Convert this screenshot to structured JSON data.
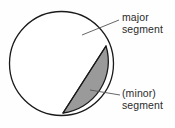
{
  "figure": {
    "background_color": "#fefefe",
    "stroke_color": "#1a1a1a",
    "fill_minor_segment": "#9a9a9a",
    "fill_major_segment": "#ffffff",
    "leader_color": "#555555"
  },
  "labels": {
    "major": {
      "line1": "major",
      "line2": "segment"
    },
    "minor": {
      "line1": "(minor)",
      "line2": "segment"
    }
  },
  "chart_data": {
    "type": "pie",
    "xlabel": "",
    "ylabel": "",
    "categories": [
      "major segment",
      "(minor) segment"
    ],
    "values": [
      81,
      19
    ],
    "legend": [
      "major segment",
      "(minor) segment"
    ],
    "annotations": [
      "major segment",
      "(minor) segment"
    ],
    "grid": false,
    "legend_position": "right",
    "geometry": {
      "circle_center_x": 61.5,
      "circle_center_y": 63.5,
      "circle_radius": 52,
      "chord_start_x": 106,
      "chord_start_y": 46,
      "chord_end_x": 63,
      "chord_end_y": 113,
      "minor_segment_fill": "#9a9a9a",
      "major_segment_fill": "#ffffff"
    },
    "leaders": [
      {
        "name": "major",
        "x1": 82,
        "y1": 35,
        "x2": 119,
        "y2": 20
      },
      {
        "name": "minor",
        "x1": 90,
        "y1": 90,
        "x2": 120,
        "y2": 95
      }
    ]
  }
}
